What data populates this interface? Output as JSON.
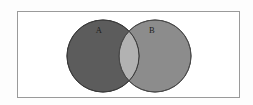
{
  "figure": {
    "name": "venn-diagram-two-sets",
    "type": "venn-diagram",
    "width": 253,
    "height": 105,
    "background_color": "#fdfdfd"
  },
  "universal_set": {
    "shape": "rectangle",
    "label": "",
    "border_color": "#9a9a9a",
    "fill_color": "#ffffff",
    "x": 17,
    "y": 11,
    "width": 223,
    "height": 87,
    "stroke_width": 1
  },
  "sets": [
    {
      "id": "set-a",
      "label": "A",
      "fill_color": "#5c5c5c",
      "stroke_color": "#3a3a3a",
      "cx": 103,
      "cy": 56,
      "r": 36,
      "label_x": 99,
      "label_y": 31,
      "label_color": "#1b1b1b"
    },
    {
      "id": "set-b",
      "label": "B",
      "fill_color": "#8c8c8c",
      "stroke_color": "#4a4a4a",
      "cx": 155,
      "cy": 56,
      "r": 36,
      "label_x": 152,
      "label_y": 31,
      "label_color": "#1b1b1b"
    }
  ],
  "intersection": {
    "id": "intersection-a-b",
    "label": "",
    "fill_color": "#b2b2b2",
    "stroke_color": "#4a4a4a"
  },
  "chart_data": {
    "type": "venn",
    "title": "",
    "subtitle": "",
    "xlabel": "",
    "ylabel": "",
    "legend": [],
    "grid": false,
    "sets": [
      "A",
      "B"
    ],
    "set_labels": [
      "A",
      "B"
    ],
    "regions": [
      {
        "name": "A only",
        "shade": "#5c5c5c"
      },
      {
        "name": "B only",
        "shade": "#8c8c8c"
      },
      {
        "name": "A and B",
        "shade": "#b2b2b2"
      },
      {
        "name": "outside A and B",
        "shade": "#ffffff"
      }
    ]
  }
}
